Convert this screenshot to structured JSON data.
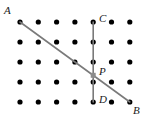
{
  "figure": {
    "name": "geometry-dot-lattice-figure",
    "width": 149,
    "height": 123,
    "background_color": "#ffffff"
  },
  "lattice": {
    "columns": 7,
    "rows": 5,
    "x_start": 20,
    "y_start": 22,
    "x_spacing": 18.3,
    "y_spacing": 20,
    "dot_radius": 2.6,
    "dot_color": "#000000"
  },
  "segments": [
    {
      "id": "segment-ab",
      "from": "A",
      "to": "B",
      "x1": 20,
      "y1": 22,
      "x2": 129.8,
      "y2": 102,
      "color": "#7a7a7a",
      "width": 1.6
    },
    {
      "id": "segment-cd",
      "from": "C",
      "to": "D",
      "x1": 93.2,
      "y1": 22,
      "x2": 93.2,
      "y2": 102,
      "color": "#7a7a7a",
      "width": 1.6
    }
  ],
  "intersection": {
    "id": "point-p",
    "label": "P",
    "x": 93.2,
    "y": 75.3,
    "marker": "square",
    "size": 5,
    "color": "#8c8c8c"
  },
  "labels": [
    {
      "id": "label-a",
      "text": "A",
      "x": 4,
      "y": 5
    },
    {
      "id": "label-c",
      "text": "C",
      "x": 99,
      "y": 13
    },
    {
      "id": "label-p",
      "text": "P",
      "x": 99,
      "y": 66
    },
    {
      "id": "label-d",
      "text": "D",
      "x": 99,
      "y": 94
    },
    {
      "id": "label-b",
      "text": "B",
      "x": 133,
      "y": 105
    }
  ]
}
